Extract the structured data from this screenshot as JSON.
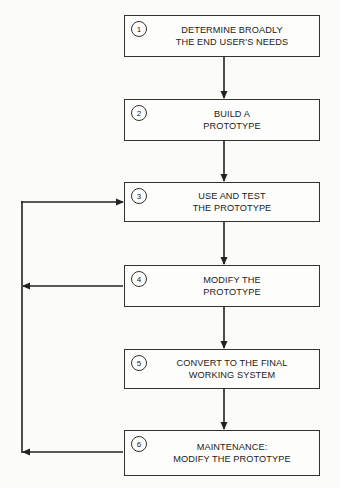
{
  "diagram": {
    "type": "flowchart",
    "steps": [
      {
        "number": "1",
        "line1": "DETERMINE BROADLY",
        "line2": "THE END USER'S NEEDS"
      },
      {
        "number": "2",
        "line1": "BUILD A",
        "line2": "PROTOTYPE"
      },
      {
        "number": "3",
        "line1": "USE AND TEST",
        "line2": "THE PROTOTYPE"
      },
      {
        "number": "4",
        "line1": "MODIFY THE",
        "line2": "PROTOTYPE"
      },
      {
        "number": "5",
        "line1": "CONVERT TO THE FINAL",
        "line2": "WORKING SYSTEM"
      },
      {
        "number": "6",
        "line1": "MAINTENANCE:",
        "line2": "MODIFY THE PROTOTYPE"
      }
    ],
    "edges": [
      {
        "from": "1",
        "to": "2"
      },
      {
        "from": "2",
        "to": "3"
      },
      {
        "from": "3",
        "to": "4"
      },
      {
        "from": "4",
        "to": "5"
      },
      {
        "from": "5",
        "to": "6"
      },
      {
        "from": "4",
        "to": "3",
        "type": "feedback-loop"
      },
      {
        "from": "6",
        "to": "3",
        "type": "feedback-loop"
      }
    ],
    "colors": {
      "line": "#222222",
      "box_border": "#333333",
      "background": "#fbfbf9"
    }
  }
}
